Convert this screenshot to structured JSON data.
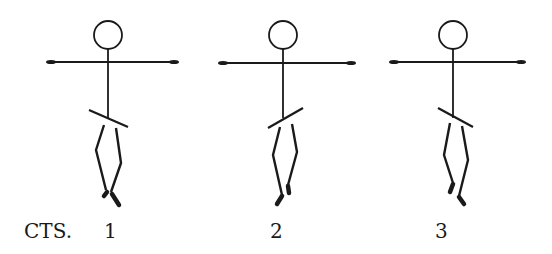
{
  "diagram": {
    "prefix_label": "CTS.",
    "stroke_color": "#1a1a1a",
    "background": "#ffffff",
    "figures": [
      {
        "count_label": "1",
        "head": {
          "cx": 108,
          "cy": 35,
          "r": 14
        },
        "arms": {
          "x1": 47,
          "x2": 178,
          "y": 62
        },
        "spine": {
          "x": 108,
          "y1": 49,
          "y2": 118
        },
        "hip": {
          "x1": 89,
          "y1": 110,
          "x2": 128,
          "y2": 127
        },
        "left_leg": "104,125 96,150 106,190",
        "right_leg": "116,128 121,163 111,192",
        "feet": [
          [
            107,
            192,
            104,
            196
          ],
          [
            112,
            194,
            119,
            205
          ]
        ],
        "label_x": 104
      },
      {
        "count_label": "2",
        "head": {
          "cx": 283,
          "cy": 35,
          "r": 14
        },
        "arms": {
          "x1": 219,
          "x2": 355,
          "y": 63
        },
        "spine": {
          "x": 283,
          "y1": 49,
          "y2": 118
        },
        "hip": {
          "x1": 268,
          "y1": 128,
          "x2": 303,
          "y2": 108
        },
        "left_leg": "280,127 273,155 282,195",
        "right_leg": "292,124 297,152 288,185",
        "feet": [
          [
            282,
            196,
            277,
            204
          ],
          [
            288,
            186,
            289,
            193
          ]
        ],
        "label_x": 270
      },
      {
        "count_label": "3",
        "head": {
          "cx": 453,
          "cy": 35,
          "r": 14
        },
        "arms": {
          "x1": 390,
          "x2": 525,
          "y": 62
        },
        "spine": {
          "x": 453,
          "y1": 49,
          "y2": 118
        },
        "hip": {
          "x1": 438,
          "y1": 108,
          "x2": 473,
          "y2": 127
        },
        "left_leg": "450,123 444,155 453,183",
        "right_leg": "462,126 468,160 459,196",
        "feet": [
          [
            453,
            184,
            450,
            192
          ],
          [
            459,
            197,
            464,
            204
          ]
        ],
        "label_x": 435
      }
    ],
    "label_baseline_y": 238,
    "prefix_x": 24
  }
}
